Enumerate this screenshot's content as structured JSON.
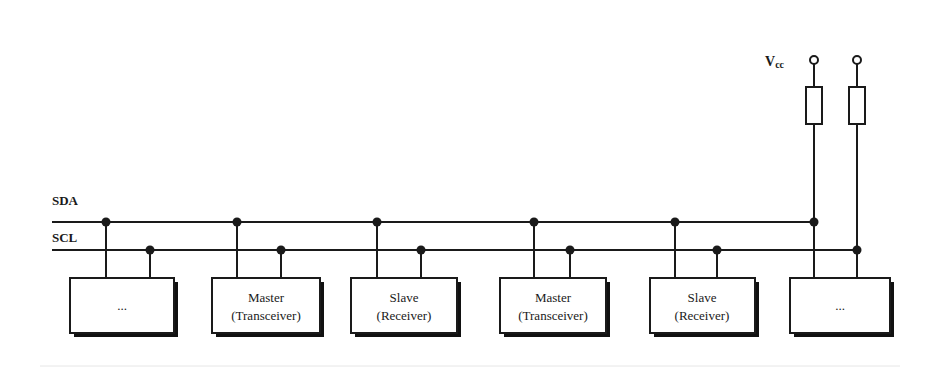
{
  "diagram": {
    "buses": [
      {
        "id": "sda",
        "label": "SDA",
        "y": 222
      },
      {
        "id": "scl",
        "label": "SCL",
        "y": 250
      }
    ],
    "supply": {
      "label": "V",
      "subscript": "cc"
    },
    "devices": [
      {
        "id": "dev-0",
        "line1": "...",
        "line2": "",
        "x": 70,
        "w": 104,
        "sda_x": 106,
        "scl_x": 150
      },
      {
        "id": "dev-1",
        "line1": "Master",
        "line2": "(Transceiver)",
        "x": 212,
        "w": 108,
        "sda_x": 237,
        "scl_x": 281
      },
      {
        "id": "dev-2",
        "line1": "Slave",
        "line2": "(Receiver)",
        "x": 351,
        "w": 106,
        "sda_x": 377,
        "scl_x": 421
      },
      {
        "id": "dev-3",
        "line1": "Master",
        "line2": "(Transceiver)",
        "x": 500,
        "w": 106,
        "sda_x": 534,
        "scl_x": 570
      },
      {
        "id": "dev-4",
        "line1": "Slave",
        "line2": "(Receiver)",
        "x": 650,
        "w": 105,
        "sda_x": 675,
        "scl_x": 717
      },
      {
        "id": "dev-5",
        "line1": "...",
        "line2": "",
        "x": 790,
        "w": 100,
        "sda_x": 814,
        "scl_x": 857
      }
    ],
    "colors": {
      "line": "#1a1a1a",
      "background": "#ffffff",
      "shadow": "#111111"
    }
  }
}
